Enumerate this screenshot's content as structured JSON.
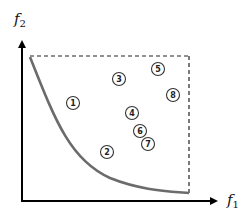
{
  "diagram": {
    "type": "pareto-front",
    "axes": {
      "x_label": "f",
      "x_subscript": "1",
      "y_label": "f",
      "y_subscript": "2"
    },
    "colors": {
      "axis": "#000000",
      "curve": "#6b6b6b",
      "dashed_box": "#222222",
      "circle": "#333333"
    },
    "points": [
      {
        "label": "1",
        "x": 73,
        "y": 103
      },
      {
        "label": "2",
        "x": 107,
        "y": 152
      },
      {
        "label": "3",
        "x": 119,
        "y": 79
      },
      {
        "label": "4",
        "x": 132,
        "y": 113
      },
      {
        "label": "5",
        "x": 158,
        "y": 69
      },
      {
        "label": "6",
        "x": 140,
        "y": 131
      },
      {
        "label": "7",
        "x": 148,
        "y": 144
      },
      {
        "label": "8",
        "x": 173,
        "y": 95
      }
    ]
  }
}
